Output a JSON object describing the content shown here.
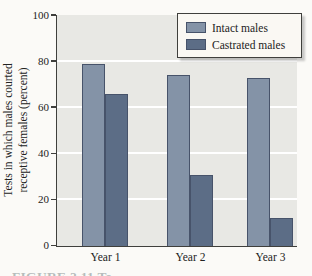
{
  "figure": {
    "ylabel_line1": "Tests in which males courted",
    "ylabel_line2": "receptive females (percent)",
    "caption_fragment": "FIGURE 2.11  Te",
    "colors": {
      "intact_bar": "#8493a7",
      "castrated_bar": "#5c6d86",
      "bar_border": "#47536a",
      "plot_bg": "#e8e8e4",
      "gridline": "#ffffff",
      "axis": "#3f3f3c",
      "text": "#222222",
      "page_bg": "#fbfaf7",
      "legend_bg": "#faf8f3",
      "legend_border": "#3f3f3c"
    }
  },
  "chart_data": {
    "type": "bar",
    "categories": [
      "Year 1",
      "Year 2",
      "Year 3"
    ],
    "series": [
      {
        "name": "Intact males",
        "values": [
          79,
          74,
          73
        ]
      },
      {
        "name": "Castrated males",
        "values": [
          66,
          31,
          12
        ]
      }
    ],
    "title": "",
    "xlabel": "",
    "ylabel": "Tests in which males courted receptive females (percent)",
    "ylim": [
      0,
      100
    ],
    "yticks": [
      0,
      20,
      40,
      60,
      80,
      100
    ],
    "grid": true,
    "legend_position": "top-right"
  }
}
